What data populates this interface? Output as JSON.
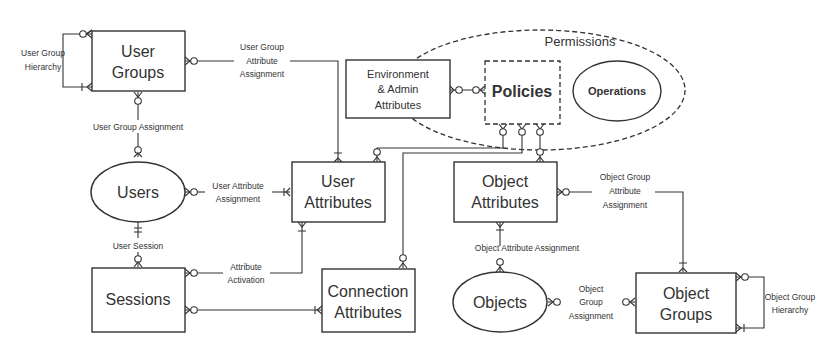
{
  "entities": {
    "user_groups": {
      "line1": "User",
      "line2": "Groups"
    },
    "users": {
      "label": "Users"
    },
    "sessions": {
      "label": "Sessions"
    },
    "user_attributes": {
      "line1": "User",
      "line2": "Attributes"
    },
    "connection_attributes": {
      "line1": "Connection",
      "line2": "Attributes"
    },
    "environment_admin_attributes": {
      "line1": "Environment",
      "line2": "& Admin",
      "line3": "Attributes"
    },
    "policies": {
      "label": "Policies"
    },
    "operations": {
      "label": "Operations"
    },
    "permissions": {
      "label": "Permissions"
    },
    "object_attributes": {
      "line1": "Object",
      "line2": "Attributes"
    },
    "objects": {
      "label": "Objects"
    },
    "object_groups": {
      "line1": "Object",
      "line2": "Groups"
    }
  },
  "relationships": {
    "user_group_hierarchy": {
      "line1": "User Group",
      "line2": "Hierarchy"
    },
    "user_group_attribute_assignment": {
      "line1": "User Group",
      "line2": "Attribute",
      "line3": "Assignment"
    },
    "user_group_assignment": {
      "label": "User Group Assignment"
    },
    "user_attribute_assignment": {
      "line1": "User Attribute",
      "line2": "Assignment"
    },
    "user_session": {
      "label": "User Session"
    },
    "attribute_activation": {
      "line1": "Attribute",
      "line2": "Activation"
    },
    "object_group_attribute_assignment": {
      "line1": "Object Group",
      "line2": "Attribute",
      "line3": "Assignment"
    },
    "object_attribute_assignment": {
      "label": "Object Attribute Assignment"
    },
    "object_group_assignment": {
      "line1": "Object",
      "line2": "Group",
      "line3": "Assignment"
    },
    "object_group_hierarchy": {
      "line1": "Object Group",
      "line2": "Hierarchy"
    }
  },
  "colors": {
    "stroke": "#333333",
    "background": "#ffffff"
  }
}
